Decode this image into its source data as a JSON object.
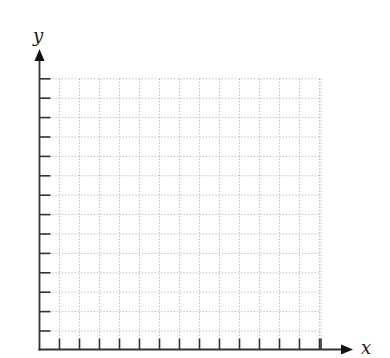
{
  "chart_data": {
    "type": "scatter",
    "title": "",
    "xlabel": "x",
    "ylabel": "y",
    "x_tick_count": 14,
    "y_tick_count": 14,
    "tick_labels_x": [],
    "tick_labels_y": [],
    "grid": true,
    "grid_style": "dotted",
    "series": [],
    "note": "Blank coordinate grid with first-quadrant axes, arrowheads on x and y axes, unlabeled ticks"
  },
  "geometry": {
    "origin": [
      39.5,
      349.5
    ],
    "x_axis_end": 353,
    "y_axis_end": 49,
    "x_first_tick": 59.5,
    "x_spacing": 20,
    "y_first_tick": 331,
    "y_spacing": 19.4,
    "tick_len": 11
  },
  "colors": {
    "axis": "#333333",
    "grid": "#b4b4b4",
    "label": "#1a1a1a"
  },
  "labels": {
    "x_axis": "x",
    "y_axis": "y"
  }
}
